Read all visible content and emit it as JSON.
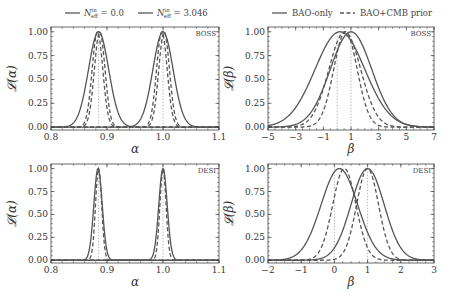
{
  "figure": {
    "width": 453,
    "height": 299,
    "line_color": "#555555",
    "guide_color": "#aaaaaa"
  },
  "legends": {
    "left": {
      "entries": [
        {
          "label": "N_eff^in = 0.0",
          "style": "solid"
        },
        {
          "label": "N_eff^in = 3.046",
          "style": "solid"
        }
      ]
    },
    "right": {
      "entries": [
        {
          "label": "BAO-only",
          "style": "solid"
        },
        {
          "label": "BAO+CMB prior",
          "style": "dashed"
        }
      ]
    }
  },
  "chart_data": [
    {
      "type": "line",
      "panel": "top-left",
      "tag": "BOSS",
      "xlabel": "α",
      "ylabel": "𝓛(α)",
      "xlim": [
        0.8,
        1.1
      ],
      "ylim": [
        -0.03,
        1.05
      ],
      "xticks": [
        0.8,
        0.9,
        1.0,
        1.1
      ],
      "xtick_labels": [
        "0.8",
        "0.9",
        "1.0",
        "1.1"
      ],
      "yticks": [
        0.0,
        0.25,
        0.5,
        0.75,
        1.0
      ],
      "ytick_labels": [
        "0.00",
        "0.25",
        "0.50",
        "0.75",
        "1.00"
      ],
      "grid": false,
      "guides": [
        0.885,
        1.0
      ],
      "series": [
        {
          "name": "N_eff^in = 0.0, BAO-only",
          "style": "solid",
          "kind": "gauss",
          "mu": 0.885,
          "sigma": 0.018
        },
        {
          "name": "N_eff^in = 3.046, BAO-only",
          "style": "solid",
          "kind": "gauss",
          "mu": 1.0,
          "sigma": 0.018
        },
        {
          "name": "N_eff^in = 0.0, BAO+CMB prior",
          "style": "dashed",
          "kind": "gauss",
          "mu": 0.887,
          "sigma": 0.0095
        },
        {
          "name": "N_eff^in = 0.0, BAO+CMB prior (2)",
          "style": "dashed",
          "kind": "gauss",
          "mu": 0.883,
          "sigma": 0.0095
        },
        {
          "name": "N_eff^in = 3.046, BAO+CMB prior",
          "style": "dashed",
          "kind": "gauss",
          "mu": 1.002,
          "sigma": 0.0095
        },
        {
          "name": "N_eff^in = 3.046, BAO+CMB prior (2)",
          "style": "dashed",
          "kind": "gauss",
          "mu": 0.998,
          "sigma": 0.0095
        }
      ]
    },
    {
      "type": "line",
      "panel": "top-right",
      "tag": "BOSS",
      "xlabel": "β",
      "ylabel": "𝓛(β)",
      "xlim": [
        -5,
        7
      ],
      "ylim": [
        -0.03,
        1.05
      ],
      "xticks": [
        -5,
        -3,
        -1,
        1,
        3,
        5,
        7
      ],
      "xtick_labels": [
        "−5",
        "−3",
        "−1",
        "1",
        "3",
        "5",
        "7"
      ],
      "yticks": [
        0.0,
        0.25,
        0.5,
        0.75,
        1.0
      ],
      "ytick_labels": [
        "0.00",
        "0.25",
        "0.50",
        "0.75",
        "1.00"
      ],
      "grid": false,
      "guides": [
        0.0,
        1.0
      ],
      "series": [
        {
          "name": "BAO-only (β≈0.2)",
          "style": "solid",
          "kind": "gauss",
          "mu": 0.2,
          "sigma": 1.8
        },
        {
          "name": "BAO-only (β≈1.0)",
          "style": "solid",
          "kind": "gauss",
          "mu": 1.0,
          "sigma": 1.5
        },
        {
          "name": "BAO+CMB prior (β≈0.6)",
          "style": "dashed",
          "kind": "gauss",
          "mu": 0.6,
          "sigma": 0.85
        },
        {
          "name": "BAO+CMB prior (β≈0.6b)",
          "style": "dashed",
          "kind": "gauss",
          "mu": 0.55,
          "sigma": 1.15
        }
      ]
    },
    {
      "type": "line",
      "panel": "bottom-left",
      "tag": "DESI",
      "xlabel": "α",
      "ylabel": "𝓛(α)",
      "xlim": [
        0.8,
        1.1
      ],
      "ylim": [
        -0.03,
        1.05
      ],
      "xticks": [
        0.8,
        0.9,
        1.0,
        1.1
      ],
      "xtick_labels": [
        "0.8",
        "0.9",
        "1.0",
        "1.1"
      ],
      "yticks": [
        0.0,
        0.25,
        0.5,
        0.75,
        1.0
      ],
      "ytick_labels": [
        "0.00",
        "0.25",
        "0.50",
        "0.75",
        "1.00"
      ],
      "grid": false,
      "guides": [
        0.885,
        1.0
      ],
      "series": [
        {
          "name": "N_eff^in = 0.0, BAO-only",
          "style": "solid",
          "kind": "gauss",
          "mu": 0.884,
          "sigma": 0.0075
        },
        {
          "name": "N_eff^in = 3.046, BAO-only",
          "style": "solid",
          "kind": "gauss",
          "mu": 1.0,
          "sigma": 0.0075
        },
        {
          "name": "N_eff^in = 0.0, BAO+CMB prior",
          "style": "dashed",
          "kind": "gauss",
          "mu": 0.885,
          "sigma": 0.0055
        },
        {
          "name": "N_eff^in = 3.046, BAO+CMB prior",
          "style": "dashed",
          "kind": "gauss",
          "mu": 1.0,
          "sigma": 0.0055
        }
      ]
    },
    {
      "type": "line",
      "panel": "bottom-right",
      "tag": "DESI",
      "xlabel": "β",
      "ylabel": "𝓛(β)",
      "xlim": [
        -2,
        3
      ],
      "ylim": [
        -0.03,
        1.05
      ],
      "xticks": [
        -2,
        -1,
        0,
        1,
        2,
        3
      ],
      "xtick_labels": [
        "−2",
        "−1",
        "0",
        "1",
        "2",
        "3"
      ],
      "yticks": [
        0.0,
        0.25,
        0.5,
        0.75,
        1.0
      ],
      "ytick_labels": [
        "0.00",
        "0.25",
        "0.50",
        "0.75",
        "1.00"
      ],
      "grid": false,
      "guides": [
        0.0,
        1.0
      ],
      "series": [
        {
          "name": "BAO-only (β≈0.15)",
          "style": "solid",
          "kind": "gauss",
          "mu": 0.15,
          "sigma": 0.55
        },
        {
          "name": "BAO-only (β≈1.0)",
          "style": "solid",
          "kind": "gauss",
          "mu": 1.0,
          "sigma": 0.5
        },
        {
          "name": "BAO+CMB prior (β≈0.3)",
          "style": "dashed",
          "kind": "gauss",
          "mu": 0.3,
          "sigma": 0.35
        },
        {
          "name": "BAO+CMB prior (β≈1.0)",
          "style": "dashed",
          "kind": "gauss",
          "mu": 1.0,
          "sigma": 0.33
        }
      ]
    }
  ]
}
